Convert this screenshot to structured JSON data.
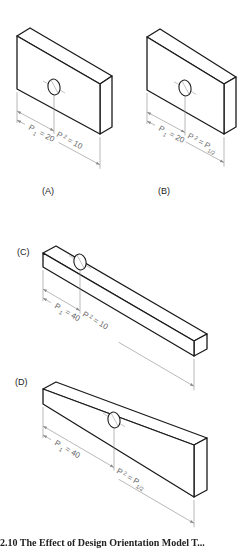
{
  "figure": {
    "caption_partial": "2.10 The Effect of Design Orientation Model T...",
    "panels": [
      {
        "id": "A",
        "label": "(A)",
        "p1_label": "P",
        "p1_sub": "1",
        "p1_value": "= 20",
        "p2_label": "P",
        "p2_sub": "2",
        "p2_value": "= 10",
        "label_pos": [
          42,
          192
        ],
        "box": {
          "ftl": [
            17,
            36
          ],
          "btl": [
            30,
            28
          ],
          "btr": [
            112,
            76
          ],
          "ftr": [
            100,
            84
          ],
          "fbl": [
            17,
            89
          ],
          "fbr": [
            100,
            134
          ],
          "bbr": [
            112,
            127
          ]
        },
        "hole": {
          "cx": 54,
          "cy": 87,
          "rx": 6,
          "ry": 8
        },
        "dim": {
          "x0": 17,
          "x_mid": 54,
          "x_end": 92,
          "y_top": 95,
          "slope": 0.54
        }
      },
      {
        "id": "B",
        "label": "(B)",
        "p1_label": "P",
        "p1_sub": "1",
        "p1_value": "= 20",
        "p2_label": "P",
        "p2_sub": "2",
        "p2_value": "= P",
        "p2_tail_sub": "1/2",
        "label_pos": [
          158,
          192
        ],
        "box": {
          "ftl": [
            147,
            37
          ],
          "btl": [
            160,
            29
          ],
          "btr": [
            236,
            77
          ],
          "ftr": [
            224,
            84
          ],
          "fbl": [
            147,
            90
          ],
          "fbr": [
            224,
            134
          ],
          "bbr": [
            236,
            127
          ]
        },
        "hole": {
          "cx": 185,
          "cy": 88,
          "rx": 6,
          "ry": 8
        },
        "dim": {
          "x0": 147,
          "x_mid": 185,
          "x_end": 222,
          "y_top": 96,
          "slope": 0.54
        }
      },
      {
        "id": "C",
        "label": "(C)",
        "p1_label": "P",
        "p1_sub": "1",
        "p1_value": "= 40",
        "p2_label": "P",
        "p2_sub": "2",
        "p2_value": "= 10",
        "label_pos": [
          17,
          253
        ],
        "box": {
          "ftl": [
            43,
            253
          ],
          "btl": [
            56,
            246
          ],
          "btr": [
            207,
            334
          ],
          "ftr": [
            194,
            341
          ],
          "fbl": [
            43,
            267
          ],
          "fbr": [
            194,
            356
          ],
          "bbr": [
            207,
            349
          ]
        },
        "hole": {
          "cx": 80,
          "cy": 262,
          "rx": 6,
          "ry": 8
        },
        "dim": {
          "x0": 43,
          "x_mid": 80,
          "x_end": 194,
          "y_top": 274,
          "slope": 0.585
        }
      },
      {
        "id": "D",
        "label": "(D)",
        "p1_label": "P",
        "p1_sub": "1",
        "p1_value": "= 40",
        "p2_label": "P",
        "p2_sub": "2",
        "p2_value": "= P",
        "p2_tail_sub": "1/2",
        "label_pos": [
          15,
          383
        ],
        "box": {
          "ftl": [
            43,
            389
          ],
          "btl": [
            56,
            382
          ],
          "btr": [
            207,
            438
          ],
          "ftr": [
            194,
            445
          ],
          "fbl": [
            43,
            404
          ],
          "fbr": [
            194,
            497
          ],
          "bbr": [
            207,
            490
          ]
        },
        "hole": {
          "cx": 114,
          "cy": 420,
          "rx": 6,
          "ry": 8
        },
        "dim": {
          "x0": 43,
          "x_mid": 114,
          "x_end": 194,
          "y_top": 409,
          "slope": 0.585
        }
      }
    ]
  }
}
